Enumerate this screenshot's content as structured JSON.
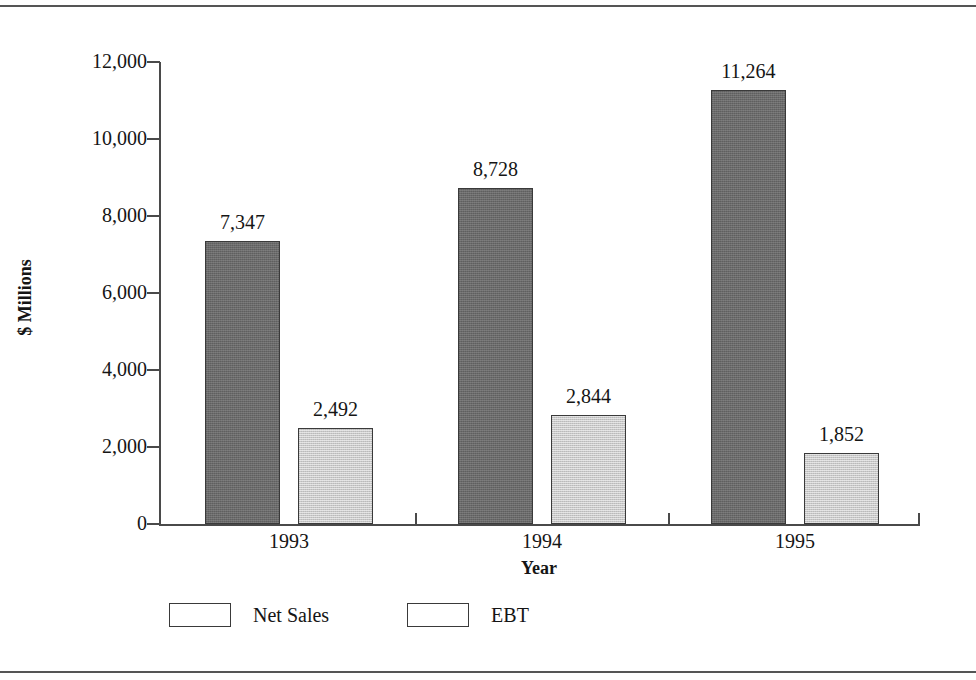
{
  "chart_data": {
    "type": "bar",
    "title": "",
    "subtitle": "",
    "xlabel": "Year",
    "ylabel": "$ Millions",
    "categories": [
      "1993",
      "1994",
      "1995"
    ],
    "series": [
      {
        "name": "Net Sales",
        "values": [
          7347,
          8728,
          11264
        ],
        "labels": [
          "7,347",
          "8,728",
          "11,264"
        ],
        "color": "#6a6a6a"
      },
      {
        "name": "EBT",
        "values": [
          2492,
          2844,
          1852
        ],
        "labels": [
          "2,492",
          "2,844",
          "1,852"
        ],
        "color": "#c8c8c8"
      }
    ],
    "ylim": [
      0,
      12000
    ],
    "ytick_values": [
      0,
      2000,
      4000,
      6000,
      8000,
      10000,
      12000
    ],
    "ytick_labels": [
      "0",
      "2,000",
      "4,000",
      "6,000",
      "8,000",
      "10,000",
      "12,000"
    ],
    "grid": false,
    "legend_position": "bottom-left",
    "axis_color": "#4a4a4a",
    "text_color": "#151515"
  }
}
